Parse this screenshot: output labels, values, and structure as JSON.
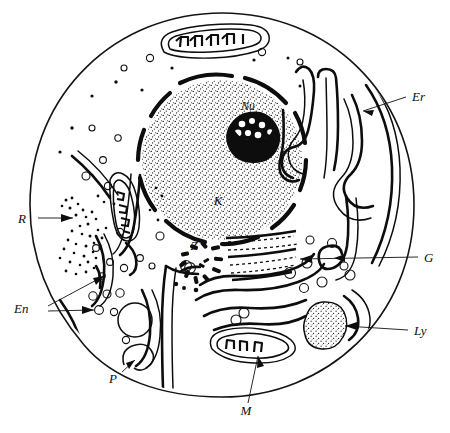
{
  "figure": {
    "type": "hand-drawn biological diagram",
    "background_color": "#ffffff",
    "ink_color": "#0d0d0d"
  },
  "labels": [
    {
      "id": "Er",
      "text": "Er",
      "meaning": "endoplasmatisches Retikulum (endoplasmic reticulum)",
      "x": 412,
      "y": 101
    },
    {
      "id": "G",
      "text": "G",
      "meaning": "Golgi-Apparat (Golgi apparatus)",
      "x": 424,
      "y": 258
    },
    {
      "id": "Ly",
      "text": "Ly",
      "meaning": "Lysosom (lysosome)",
      "x": 414,
      "y": 333
    },
    {
      "id": "M",
      "text": "M",
      "meaning": "Mitochondrium (mitochondrion)",
      "x": 246,
      "y": 412
    },
    {
      "id": "P",
      "text": "P",
      "meaning": "Pinozytose (pinocytosis vesicle)",
      "x": 117,
      "y": 380
    },
    {
      "id": "En",
      "text": "En",
      "meaning": "Endosom / Vesikel (vesicles)",
      "x": 30,
      "y": 311
    },
    {
      "id": "R",
      "text": "R",
      "meaning": "Ribosomen (ribosomes)",
      "x": 25,
      "y": 221
    },
    {
      "id": "K",
      "text": "K",
      "meaning": "Kern (nucleus)",
      "x": 221,
      "y": 201
    },
    {
      "id": "Nu",
      "text": "Nu",
      "meaning": "Nucleolus (nucleolus)",
      "x": 248,
      "y": 127
    },
    {
      "id": "Z",
      "text": "Z",
      "meaning": "Zentriol (centriole)",
      "x": 196,
      "y": 248
    }
  ],
  "structures": {
    "cell_membrane": "outer circle",
    "nucleus": "large stippled sphere with segmented nuclear envelope (pores)",
    "nucleolus": "dark blotch with light vacuoles inside nucleus",
    "mitochondria": [
      "top",
      "left",
      "bottom-centre"
    ],
    "endoplasmic_reticulum": "stacked U-shaped cisternae on right side",
    "golgi_apparatus": "curved flattened cisternae below nucleus",
    "lysosome": "stippled oval, lower right",
    "ribosomes": "clusters of fine dots, left side",
    "vesicles": "small open circles throughout cytoplasm",
    "centriole": "radiating short dashes left of Golgi",
    "pinocytosis": "invagination of cell membrane, bottom left",
    "vacuole": "large clear circle, lower left"
  }
}
